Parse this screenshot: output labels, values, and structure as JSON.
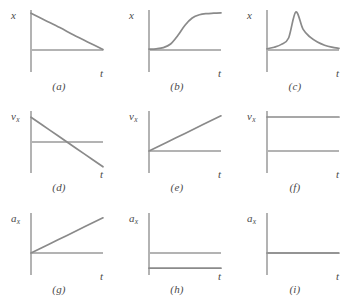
{
  "figure": {
    "title": "",
    "rows": 3,
    "cols": 3,
    "axis_color": "#b3b3b3",
    "curve_color": "#8a8a8a",
    "text_color": "#4a4a4a",
    "background": "#ffffff"
  },
  "chart_data": {
    "type": "line",
    "title": "",
    "xlabel": "t",
    "ylabel": "",
    "grid": false,
    "legend": "none",
    "panels": [
      {
        "id": "a",
        "caption": "(a)",
        "ylabel": "x",
        "ylabel_base": "x",
        "ylabel_sub": "",
        "xlabel": "t",
        "description": "straight line with negative slope starting at positive x, crossing zero near the right end of the axis",
        "x": [
          0,
          0.2,
          0.4,
          0.6,
          0.8,
          1.0
        ],
        "y": [
          0.92,
          0.74,
          0.56,
          0.37,
          0.19,
          0.01
        ],
        "ylim": [
          -0.55,
          1.0
        ],
        "xlim": [
          0,
          1
        ]
      },
      {
        "id": "b",
        "caption": "(b)",
        "ylabel": "x",
        "ylabel_base": "x",
        "ylabel_sub": "",
        "xlabel": "t",
        "description": "S-shaped sigmoid curve, flat near zero then rising to a high plateau",
        "x": [
          0,
          0.1,
          0.2,
          0.3,
          0.4,
          0.5,
          0.6,
          0.7,
          0.8,
          0.9,
          1.0
        ],
        "y": [
          0.02,
          0.03,
          0.06,
          0.15,
          0.36,
          0.62,
          0.8,
          0.88,
          0.91,
          0.92,
          0.93
        ],
        "ylim": [
          -0.55,
          1.0
        ],
        "xlim": [
          0,
          1
        ]
      },
      {
        "id": "c",
        "caption": "(c)",
        "ylabel": "x",
        "ylabel_base": "x",
        "ylabel_sub": "",
        "xlabel": "t",
        "description": "sharp cusp peak: concave-up rise to a maximum at about 40 percent, then concave-up decay toward zero",
        "x": [
          0,
          0.1,
          0.2,
          0.3,
          0.4,
          0.5,
          0.6,
          0.7,
          0.8,
          0.9,
          1.0
        ],
        "y": [
          0.03,
          0.07,
          0.14,
          0.3,
          0.95,
          0.52,
          0.32,
          0.2,
          0.12,
          0.07,
          0.04
        ],
        "ylim": [
          -0.55,
          1.0
        ],
        "xlim": [
          0,
          1
        ]
      },
      {
        "id": "d",
        "caption": "(d)",
        "ylabel": "vx",
        "ylabel_base": "v",
        "ylabel_sub": "x",
        "xlabel": "t",
        "description": "straight line with negative slope, starting positive and crossing zero near mid-axis, ending negative",
        "x": [
          0,
          0.25,
          0.5,
          0.75,
          1.0
        ],
        "y": [
          0.8,
          0.4,
          0.0,
          -0.4,
          -0.8
        ],
        "ylim": [
          -1.0,
          1.0
        ],
        "xlim": [
          0,
          1
        ]
      },
      {
        "id": "e",
        "caption": "(e)",
        "ylabel": "vx",
        "ylabel_base": "v",
        "ylabel_sub": "x",
        "xlabel": "t",
        "description": "straight line rising from the origin with constant positive slope",
        "x": [
          0,
          0.25,
          0.5,
          0.75,
          1.0
        ],
        "y": [
          0.0,
          0.22,
          0.44,
          0.66,
          0.88
        ],
        "ylim": [
          -0.55,
          1.0
        ],
        "xlim": [
          0,
          1
        ]
      },
      {
        "id": "f",
        "caption": "(f)",
        "ylabel": "vx",
        "ylabel_base": "v",
        "ylabel_sub": "x",
        "xlabel": "t",
        "description": "horizontal line at a constant positive value above the time axis",
        "x": [
          0,
          0.5,
          1.0
        ],
        "y": [
          0.85,
          0.85,
          0.85
        ],
        "ylim": [
          -0.55,
          1.0
        ],
        "xlim": [
          0,
          1
        ]
      },
      {
        "id": "g",
        "caption": "(g)",
        "ylabel": "ax",
        "ylabel_base": "a",
        "ylabel_sub": "x",
        "xlabel": "t",
        "description": "straight line rising from the origin with constant positive slope",
        "x": [
          0,
          0.25,
          0.5,
          0.75,
          1.0
        ],
        "y": [
          0.0,
          0.22,
          0.44,
          0.66,
          0.88
        ],
        "ylim": [
          -0.55,
          1.0
        ],
        "xlim": [
          0,
          1
        ]
      },
      {
        "id": "h",
        "caption": "(h)",
        "ylabel": "ax",
        "ylabel_base": "a",
        "ylabel_sub": "x",
        "xlabel": "t",
        "description": "horizontal line at a constant negative value below the time axis",
        "x": [
          0,
          0.5,
          1.0
        ],
        "y": [
          -0.38,
          -0.38,
          -0.38
        ],
        "ylim": [
          -0.55,
          1.0
        ],
        "xlim": [
          0,
          1
        ]
      },
      {
        "id": "i",
        "caption": "(i)",
        "ylabel": "ax",
        "ylabel_base": "a",
        "ylabel_sub": "x",
        "xlabel": "t",
        "description": "horizontal line lying exactly on the time axis, constant zero",
        "x": [
          0,
          0.5,
          1.0
        ],
        "y": [
          0.0,
          0.0,
          0.0
        ],
        "ylim": [
          -0.55,
          1.0
        ],
        "xlim": [
          0,
          1
        ]
      }
    ]
  }
}
